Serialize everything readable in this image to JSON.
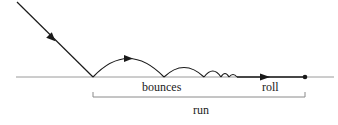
{
  "diagram": {
    "labels": {
      "bounces": "bounces",
      "roll": "roll",
      "run": "run"
    },
    "colors": {
      "ink": "#1a1a1a",
      "ground": "#9a9a9a",
      "bracket": "#8a8a8a"
    },
    "elements": [
      "incoming-trajectory",
      "ground-line",
      "bounce-arcs",
      "roll-segment",
      "stop-point",
      "run-bracket"
    ]
  }
}
